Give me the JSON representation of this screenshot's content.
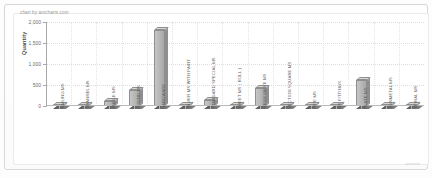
{
  "credit": "chart by amcharts.com",
  "watermark": "amcharts",
  "chart_data": {
    "type": "bar",
    "title": "",
    "subtitle": "",
    "xlabel": "",
    "ylabel": "Quantity",
    "ylim": [
      0,
      2000
    ],
    "yticks": [
      "0",
      "500",
      "1,000",
      "1,500",
      "2,000"
    ],
    "ytick_values": [
      0,
      500,
      1000,
      1500,
      2000
    ],
    "grid": true,
    "legend": false,
    "legend_position": "none",
    "style": "3d-column",
    "bar_color": "#b4b4b4",
    "categories": [
      "RAILING MS",
      "CHANNEL MS",
      "ANGLE MS",
      "ROUND MS",
      "HARDWARE",
      "SILVER MS WITH PAINT",
      "STANDARD SPECIAL MS",
      "SHEET MS ( ROLL )",
      "MESH VALVE MS",
      "SECTION SQUARE MS",
      "PIPE MS",
      "MS FITTINGS",
      "PLATE MS",
      "GUNMETAL MS",
      "SPIRAL MS"
    ],
    "values": [
      30,
      18,
      110,
      380,
      1800,
      12,
      140,
      20,
      430,
      25,
      10,
      14,
      620,
      22,
      16
    ]
  }
}
